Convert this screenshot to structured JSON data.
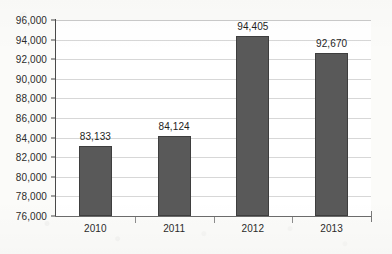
{
  "chart_data": {
    "type": "bar",
    "title": "",
    "subtitle": "",
    "xlabel": "",
    "ylabel": "",
    "categories": [
      "2010",
      "2011",
      "2012",
      "2013"
    ],
    "values": [
      83133,
      94405,
      84124,
      92670
    ],
    "series": [
      {
        "name": "",
        "values": [
          83133,
          84124,
          94405,
          92670
        ]
      }
    ],
    "data_labels": [
      "83,133",
      "84,124",
      "94,405",
      "92,670"
    ],
    "ylim": [
      76000,
      96000
    ],
    "ytick_step": 2000,
    "ytick_labels": [
      "96,000",
      "94,000",
      "92,000",
      "90,000",
      "88,000",
      "86,000",
      "84,000",
      "82,000",
      "80,000",
      "78,000",
      "76,000"
    ],
    "ytick_values": [
      96000,
      94000,
      92000,
      90000,
      88000,
      86000,
      84000,
      82000,
      80000,
      78000,
      76000
    ],
    "grid": true,
    "legend": false,
    "legend_position": "none",
    "colors": {
      "bar_fill": "#595959",
      "bar_border": "#3e3e3e",
      "gridline": "#d7d7d7",
      "axis": "#4a4a4a",
      "text": "#2b2b2b",
      "plot_background": "#ffffff",
      "page_background": "#fbfbf9"
    }
  }
}
